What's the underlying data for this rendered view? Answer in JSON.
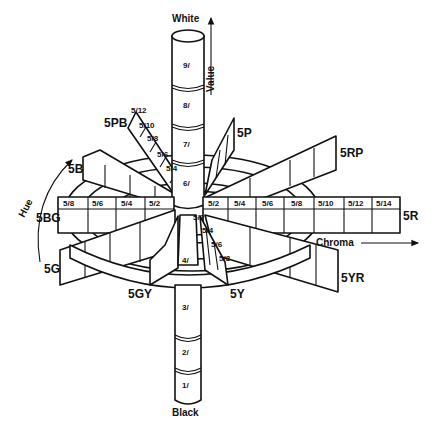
{
  "diagram": {
    "axes": {
      "value": {
        "label": "Value",
        "top_label": "White",
        "bottom_label": "Black"
      },
      "chroma": {
        "label": "Chroma"
      },
      "hue": {
        "label": "Hue"
      }
    },
    "value_levels": [
      "9/",
      "8/",
      "7/",
      "6/",
      "4/",
      "3/",
      "2/",
      "1/"
    ],
    "hues": {
      "R": "5R",
      "YR": "5YR",
      "Y": "5Y",
      "GY": "5GY",
      "G": "5G",
      "BG": "5BG",
      "B": "5B",
      "PB": "5PB",
      "P": "5P",
      "RP": "5RP"
    },
    "chroma_R": [
      "5/2",
      "5/4",
      "5/6",
      "5/8",
      "5/10",
      "5/12",
      "5/14"
    ],
    "chroma_BG": [
      "5/8",
      "5/6",
      "5/4",
      "5/2"
    ],
    "chroma_PB": [
      "5/12",
      "5/10",
      "5/8",
      "5/6",
      "5/4"
    ],
    "chroma_Y": [
      "5/2",
      "5/4",
      "5/6",
      "5/8"
    ],
    "colors": {
      "ink": "#111111",
      "paper": "#ffffff"
    }
  }
}
